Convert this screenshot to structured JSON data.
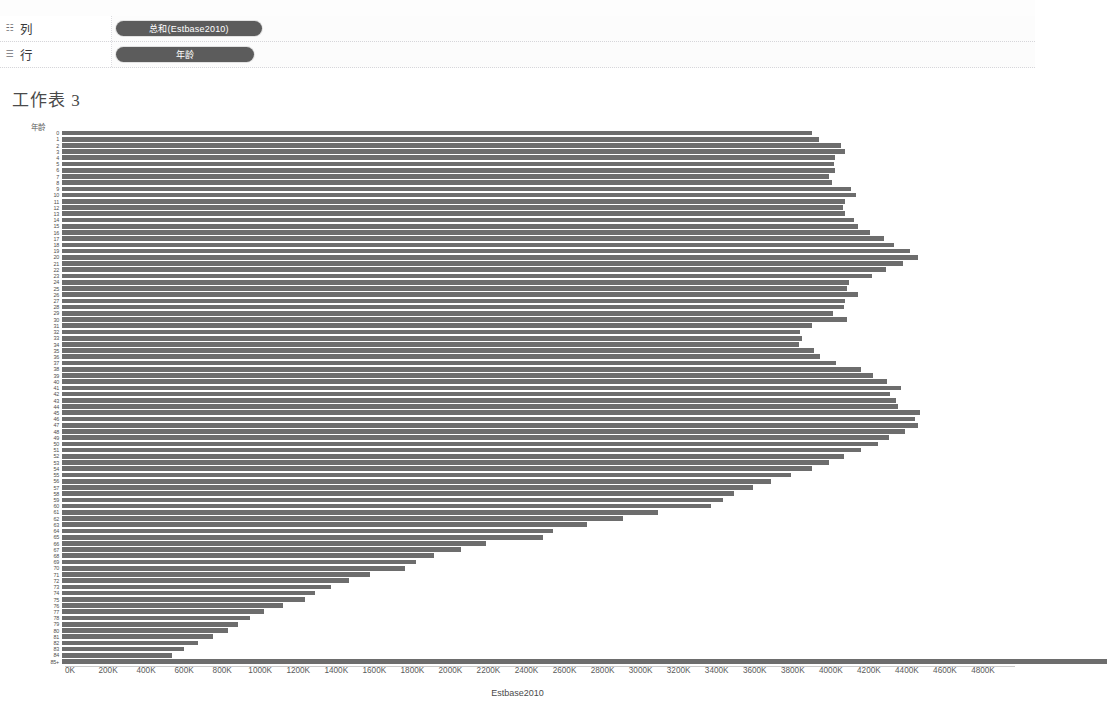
{
  "window": {
    "top_strip_ghost_text": "· ·· · ·· ·· ·· · ·· ··· ·· · ·· ·· · ··· ·· · ·· ·"
  },
  "shelves": [
    {
      "icon": "columns-icon",
      "icon_glyph": "☷",
      "name": "列",
      "pill": "总和(Estbase2010)"
    },
    {
      "icon": "rows-icon",
      "icon_glyph": "☰",
      "name": "行",
      "pill": "年龄"
    }
  ],
  "worksheet": {
    "title": "工作表 3"
  },
  "chart_data": {
    "type": "bar",
    "orientation": "horizontal",
    "title": "工作表 3",
    "xlabel": "Estbase2010",
    "ylabel": "年龄",
    "xlim": [
      0,
      4800000
    ],
    "xtick_labels": [
      "0K",
      "200K",
      "400K",
      "600K",
      "800K",
      "1000K",
      "1200K",
      "1400K",
      "1600K",
      "1800K",
      "2000K",
      "2200K",
      "2400K",
      "2600K",
      "2800K",
      "3000K",
      "3200K",
      "3400K",
      "3600K",
      "3800K",
      "4000K",
      "4200K",
      "4400K",
      "4600K",
      "4800K"
    ],
    "xtick_values": [
      0,
      200000,
      400000,
      600000,
      800000,
      1000000,
      1200000,
      1400000,
      1600000,
      1800000,
      2000000,
      2200000,
      2400000,
      2600000,
      2800000,
      3000000,
      3200000,
      3400000,
      3600000,
      3800000,
      4000000,
      4200000,
      4400000,
      4600000,
      4800000
    ],
    "grid": false,
    "legend": null,
    "categories": [
      "0",
      "1",
      "2",
      "3",
      "4",
      "5",
      "6",
      "7",
      "8",
      "9",
      "10",
      "11",
      "12",
      "13",
      "14",
      "15",
      "16",
      "17",
      "18",
      "19",
      "20",
      "21",
      "22",
      "23",
      "24",
      "25",
      "26",
      "27",
      "28",
      "29",
      "30",
      "31",
      "32",
      "33",
      "34",
      "35",
      "36",
      "37",
      "38",
      "39",
      "40",
      "41",
      "42",
      "43",
      "44",
      "45",
      "46",
      "47",
      "48",
      "49",
      "50",
      "51",
      "52",
      "53",
      "54",
      "55",
      "56",
      "57",
      "58",
      "59",
      "60",
      "61",
      "62",
      "63",
      "64",
      "65",
      "66",
      "67",
      "68",
      "69",
      "70",
      "71",
      "72",
      "73",
      "74",
      "75",
      "76",
      "77",
      "78",
      "79",
      "80",
      "81",
      "82",
      "83",
      "84",
      "85+"
    ],
    "values": [
      3944153,
      3978070,
      4096929,
      4119040,
      4063170,
      4056858,
      4066381,
      4030579,
      4046486,
      4148353,
      4172541,
      4114415,
      4106243,
      4118013,
      4165982,
      4186830,
      4246738,
      4323091,
      4374886,
      4456250,
      4500178,
      4423418,
      4331798,
      4259491,
      4134962,
      4125425,
      4187062,
      4115511,
      4110590,
      4055018,
      4127213,
      3944278,
      3878712,
      3888073,
      3876828,
      3952423,
      3984682,
      4071256,
      4202008,
      4261884,
      4337538,
      4410762,
      4352843,
      4387179,
      4393247,
      4512245,
      4487149,
      4500763,
      4431416,
      4347408,
      4290129,
      4201122,
      4112598,
      4034287,
      3943106,
      3830843,
      3726151,
      3632051,
      3532297,
      3474303,
      3412553,
      3135579,
      2950444,
      2759734,
      2580258,
      2528689,
      2228060,
      2097395,
      1957279,
      1858723,
      1805568,
      1621392,
      1507026,
      1415057,
      1332368,
      1279716,
      1162385,
      1061307,
      990996,
      925165,
      872531,
      793364,
      714004,
      639981,
      577771,
      5493433
    ],
    "max_value": 4700000,
    "bar_color": "#6d6d6d"
  }
}
